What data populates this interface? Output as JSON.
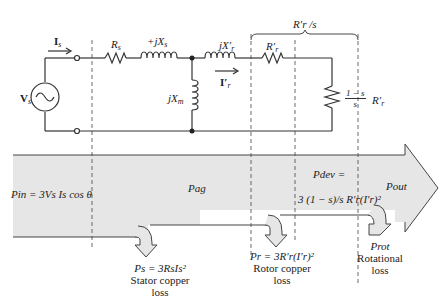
{
  "circuit": {
    "source_label": "V",
    "source_sub": "s",
    "stator_current": "I",
    "stator_current_sub": "s",
    "stator_resistance": "R",
    "stator_resistance_sub": "s",
    "stator_reactance": "+jX",
    "stator_reactance_sub": "s",
    "magnetizing_reactance": "jX",
    "magnetizing_reactance_sub": "m",
    "rotor_reactance": "jX′",
    "rotor_reactance_sub": "r",
    "rotor_current": "I′",
    "rotor_current_sub": "r",
    "rotor_resistance": "R′",
    "rotor_resistance_sub": "r",
    "load_fraction_num": "1 − s",
    "load_fraction_den": "s",
    "load_resistance": "R′",
    "load_resistance_sub": "r",
    "bracket_label": "R′r /s"
  },
  "power_flow": {
    "input": "Pin = 3Vs Is cos θ",
    "airgap": "Pag",
    "developed_line1": "Pdev =",
    "developed_line2": "3 (1 − s)/s R′r(I′r)²",
    "output": "Pout",
    "losses": [
      {
        "formula": "Ps = 3RsIs²",
        "name_line1": "Stator copper",
        "name_line2": "loss"
      },
      {
        "formula": "Pr = 3R′r(I′r)²",
        "name_line1": "Rotor copper",
        "name_line2": "loss"
      },
      {
        "formula": "Prot",
        "name_line1": "Rotational",
        "name_line2": "loss"
      }
    ]
  },
  "colors": {
    "band_fill": "#e6e6e6",
    "line": "#333333"
  }
}
